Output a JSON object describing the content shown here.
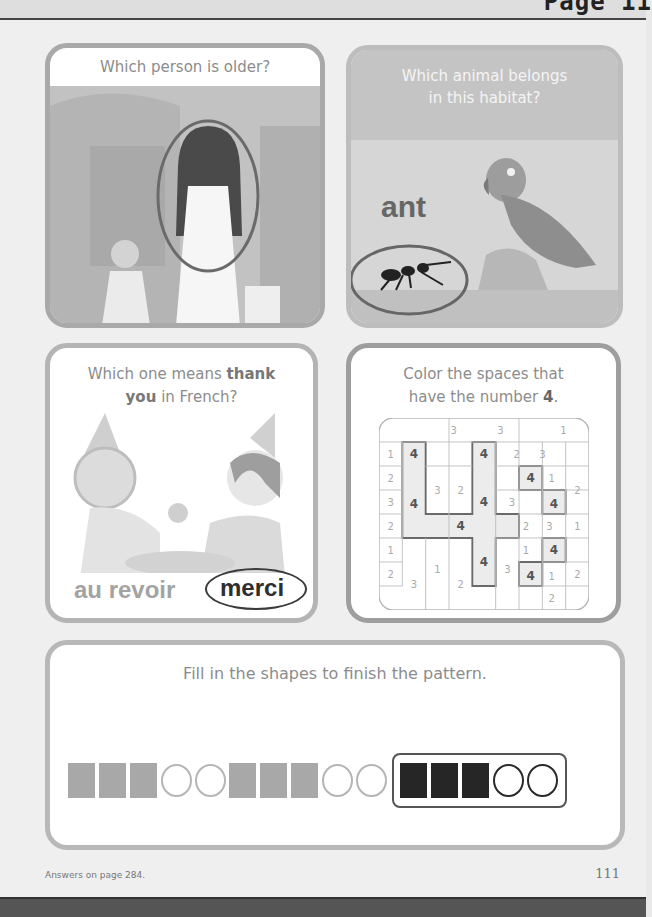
{
  "header": {
    "page_label": "Page 11"
  },
  "cards": {
    "older": {
      "question": "Which person is older?",
      "circled": "woman"
    },
    "habitat": {
      "question_line1": "Which animal belongs",
      "question_line2": "in this habitat?",
      "word": "ant",
      "circled": "ant"
    },
    "french": {
      "question_prefix": "Which one means ",
      "question_bold1": "thank",
      "question_bold2": "you",
      "question_suffix": " in French?",
      "option1": "au revoir",
      "option2": "merci",
      "circled": "merci"
    },
    "color": {
      "question_line1": "Color the spaces that",
      "question_line2_prefix": "have the number ",
      "question_line2_bold": "4",
      "question_line2_suffix": ".",
      "target_number": "4",
      "grid_numbers": [
        {
          "n": "3",
          "x": 3.2,
          "y": 0.5
        },
        {
          "n": "3",
          "x": 5.2,
          "y": 0.5
        },
        {
          "n": "1",
          "x": 7.9,
          "y": 0.5
        },
        {
          "n": "1",
          "x": 0.5,
          "y": 1.5
        },
        {
          "n": "4",
          "x": 1.5,
          "y": 1.5
        },
        {
          "n": "4",
          "x": 4.5,
          "y": 1.5
        },
        {
          "n": "2",
          "x": 5.9,
          "y": 1.5
        },
        {
          "n": "3",
          "x": 7.0,
          "y": 1.5
        },
        {
          "n": "2",
          "x": 0.5,
          "y": 2.5
        },
        {
          "n": "4",
          "x": 6.5,
          "y": 2.5
        },
        {
          "n": "1",
          "x": 7.4,
          "y": 2.5
        },
        {
          "n": "3",
          "x": 2.5,
          "y": 3.0
        },
        {
          "n": "2",
          "x": 3.5,
          "y": 3.0
        },
        {
          "n": "2",
          "x": 8.5,
          "y": 3.0
        },
        {
          "n": "3",
          "x": 0.5,
          "y": 3.5
        },
        {
          "n": "4",
          "x": 1.5,
          "y": 3.6
        },
        {
          "n": "4",
          "x": 4.5,
          "y": 3.5
        },
        {
          "n": "3",
          "x": 5.7,
          "y": 3.5
        },
        {
          "n": "4",
          "x": 7.5,
          "y": 3.6
        },
        {
          "n": "2",
          "x": 0.5,
          "y": 4.5
        },
        {
          "n": "4",
          "x": 3.5,
          "y": 4.5
        },
        {
          "n": "2",
          "x": 6.3,
          "y": 4.5
        },
        {
          "n": "3",
          "x": 7.3,
          "y": 4.5
        },
        {
          "n": "1",
          "x": 8.5,
          "y": 4.5
        },
        {
          "n": "1",
          "x": 0.5,
          "y": 5.5
        },
        {
          "n": "1",
          "x": 6.3,
          "y": 5.5
        },
        {
          "n": "4",
          "x": 7.5,
          "y": 5.5
        },
        {
          "n": "4",
          "x": 4.5,
          "y": 6.0
        },
        {
          "n": "1",
          "x": 2.5,
          "y": 6.3
        },
        {
          "n": "3",
          "x": 5.5,
          "y": 6.3
        },
        {
          "n": "2",
          "x": 8.5,
          "y": 6.5
        },
        {
          "n": "2",
          "x": 0.5,
          "y": 6.5
        },
        {
          "n": "4",
          "x": 6.5,
          "y": 6.6
        },
        {
          "n": "1",
          "x": 7.4,
          "y": 6.6
        },
        {
          "n": "3",
          "x": 1.5,
          "y": 6.9
        },
        {
          "n": "2",
          "x": 3.5,
          "y": 6.9
        },
        {
          "n": "2",
          "x": 7.4,
          "y": 7.5
        }
      ]
    },
    "pattern": {
      "question": "Fill in the shapes to finish the pattern.",
      "sequence": [
        "square-gray",
        "square-gray",
        "square-gray",
        "circle",
        "circle",
        "square-gray",
        "square-gray",
        "square-gray",
        "circle",
        "circle"
      ],
      "answer": [
        "square-filled",
        "square-filled",
        "square-filled",
        "circle",
        "circle"
      ]
    }
  },
  "footer": {
    "answers_note": "Answers on page 284.",
    "page_number": "111"
  },
  "colors": {
    "question_text": "#8c8c8c",
    "card_border": "#a9a9a9",
    "shape_gray": "#a8a8a8",
    "shape_dark": "#262626"
  }
}
